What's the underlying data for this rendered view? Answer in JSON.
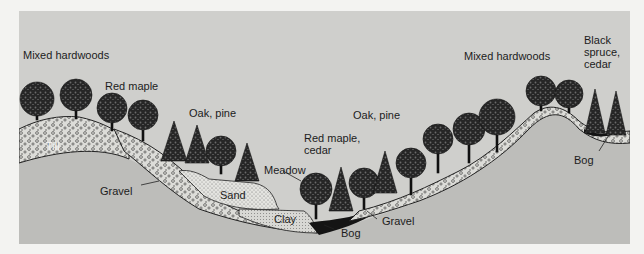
{
  "diagram": {
    "type": "landscape-cross-section",
    "vegetation_labels": [
      {
        "id": "mixed-hardwoods-left",
        "text": "Mixed hardwoods"
      },
      {
        "id": "red-maple-left",
        "text": "Red maple"
      },
      {
        "id": "oak-pine-left",
        "text": "Oak, pine"
      },
      {
        "id": "meadow",
        "text": "Meadow"
      },
      {
        "id": "red-maple-cedar",
        "text": "Red maple,\ncedar"
      },
      {
        "id": "oak-pine-right",
        "text": "Oak, pine"
      },
      {
        "id": "mixed-hardwoods-right",
        "text": "Mixed hardwoods"
      },
      {
        "id": "black-spruce-cedar",
        "text": "Black\nspruce,\ncedar"
      }
    ],
    "soil_labels": [
      {
        "id": "till",
        "text": "Till"
      },
      {
        "id": "gravel-left",
        "text": "Gravel"
      },
      {
        "id": "sand",
        "text": "Sand"
      },
      {
        "id": "clay",
        "text": "Clay"
      },
      {
        "id": "bog-center",
        "text": "Bog"
      },
      {
        "id": "gravel-right",
        "text": "Gravel"
      },
      {
        "id": "bog-right",
        "text": "Bog"
      }
    ],
    "colors": {
      "page_background": "#f3f3f1",
      "sky": "#cfcfcc",
      "bedrock": "#bdbdba",
      "gravel_fill": "#dcdcd8",
      "sand_fill": "#e2e2de",
      "tree_dark": "#1e1e1e",
      "bog_dark": "#141414",
      "text": "#1c1c1c"
    }
  }
}
